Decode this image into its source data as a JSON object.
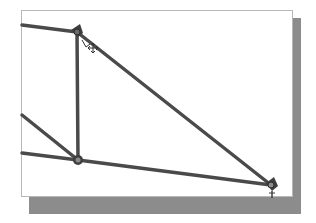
{
  "viewport": {
    "background": "#ffffff",
    "border_color": "#b8b8b8",
    "shadow_color": "#8c8c8c"
  },
  "diagram": {
    "type": "truss-linkage",
    "stroke_color": "#4a4a4a",
    "stroke_width": 3.5,
    "nodes": [
      {
        "id": "A",
        "x": 77,
        "y": 32
      },
      {
        "id": "B",
        "x": 78,
        "y": 160
      },
      {
        "id": "C",
        "x": 271,
        "y": 185
      }
    ],
    "members": [
      {
        "from": [
          21,
          25
        ],
        "to": [
          77,
          32
        ]
      },
      {
        "from": [
          77,
          32
        ],
        "to": [
          78,
          160
        ]
      },
      {
        "from": [
          77,
          32
        ],
        "to": [
          271,
          185
        ]
      },
      {
        "from": [
          21,
          115
        ],
        "to": [
          78,
          160
        ]
      },
      {
        "from": [
          21,
          153
        ],
        "to": [
          78,
          160
        ]
      },
      {
        "from": [
          78,
          160
        ],
        "to": [
          271,
          185
        ]
      }
    ],
    "cursor": {
      "type": "move-cursor",
      "x": 90,
      "y": 48
    }
  }
}
